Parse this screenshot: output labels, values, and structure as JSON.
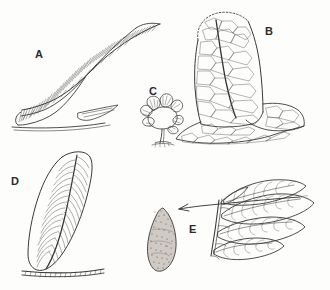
{
  "figure": {
    "background_color": "#fdfdfc",
    "ink_color": "#3a3a3a",
    "label_color": "#2b2b2b",
    "panels": [
      {
        "id": "A",
        "label": "A",
        "label_x": 35,
        "label_y": 49,
        "description": "Large curved elongate frond with dense fine parallel striations, resting on a substrate line"
      },
      {
        "id": "B",
        "label": "B",
        "label_x": 265,
        "label_y": 26,
        "description": "Rounded-apex blade with polygonal cellular reticulation and a dotted outline at the apex"
      },
      {
        "id": "C",
        "label": "C",
        "label_x": 149,
        "label_y": 86,
        "description": "Small fan-shaped lobed frondlet on a short stalk"
      },
      {
        "id": "D",
        "label": "D",
        "label_x": 11,
        "label_y": 176,
        "description": "Lanceolate leaf with midrib and pinnate lateral veins standing on a hatched ground line"
      },
      {
        "id": "E",
        "label": "E",
        "label_x": 189,
        "label_y": 224,
        "description": "Pinnate frond with several leaflets; arrow points left toward the stippled ovoid seed"
      }
    ],
    "annotations": [
      {
        "name": "seed-arrow",
        "type": "arrow",
        "direction": "left",
        "from_x": 300,
        "from_y": 199,
        "to_x": 178,
        "to_y": 208
      },
      {
        "name": "seed-body",
        "type": "ovoid",
        "description": "Dark stippled seed / sporangium",
        "center_x": 165,
        "center_y": 240
      }
    ]
  }
}
